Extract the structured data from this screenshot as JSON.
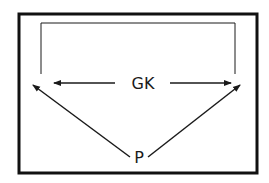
{
  "diagram": {
    "type": "relationship-diagram",
    "colors": {
      "stroke": "#1a1a1a",
      "frame": "#111111",
      "background": "#ffffff"
    },
    "nodes": [
      {
        "id": "GK",
        "label": "GK"
      },
      {
        "id": "P",
        "label": "P"
      }
    ],
    "edges": [
      {
        "from": "GK",
        "to": "left-end",
        "style": "arrow"
      },
      {
        "from": "GK",
        "to": "right-end",
        "style": "arrow"
      },
      {
        "from": "P",
        "to": "left-end",
        "style": "arrow"
      },
      {
        "from": "P",
        "to": "right-end",
        "style": "arrow"
      },
      {
        "from": "left-end",
        "to": "right-end",
        "style": "bracket-connector"
      }
    ]
  }
}
